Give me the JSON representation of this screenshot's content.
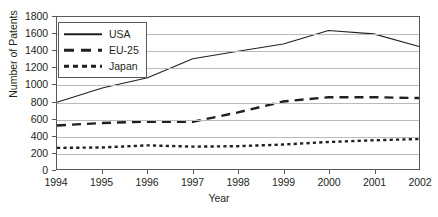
{
  "chart_data": {
    "type": "line",
    "title": "",
    "xlabel": "Year",
    "ylabel": "Number of Patents",
    "categories": [
      "1994",
      "1995",
      "1996",
      "1997",
      "1998",
      "1999",
      "2000",
      "2001",
      "2002"
    ],
    "x": [
      1994,
      1995,
      1996,
      1997,
      1998,
      1999,
      2000,
      2001,
      2002
    ],
    "xlim": [
      1994,
      2002
    ],
    "ylim": [
      0,
      1800
    ],
    "ytick_step": 200,
    "yticks": [
      1800,
      1600,
      1400,
      1200,
      1000,
      800,
      600,
      400,
      200,
      0
    ],
    "ytick_labels": [
      "1800",
      "1600",
      "1400",
      "1200",
      "1000",
      "800",
      "600",
      "400",
      "200",
      "0"
    ],
    "grid": "horizontal",
    "legend_position": "top-left-inside",
    "series": [
      {
        "name": "USA",
        "style": "solid",
        "values": [
          790,
          960,
          1080,
          1305,
          1395,
          1480,
          1640,
          1600,
          1450
        ]
      },
      {
        "name": "EU-25",
        "style": "dashed",
        "values": [
          515,
          545,
          560,
          560,
          670,
          800,
          850,
          850,
          840
        ]
      },
      {
        "name": "Japan",
        "style": "dotted",
        "values": [
          250,
          255,
          280,
          265,
          270,
          290,
          320,
          340,
          355
        ]
      }
    ]
  },
  "legend": {
    "entries": [
      {
        "label": "USA"
      },
      {
        "label": "EU-25"
      },
      {
        "label": "Japan"
      }
    ]
  },
  "colors": {
    "ink": "#231f20",
    "gridline": "#b9babc",
    "frame": "#58585a",
    "background": "#ffffff"
  }
}
